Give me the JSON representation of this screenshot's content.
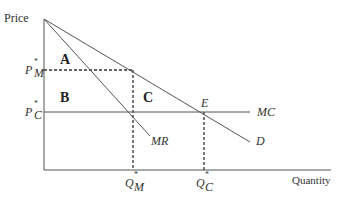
{
  "diagram": {
    "axes": {
      "y_label": "Price",
      "x_label": "Quantity"
    },
    "price_levels": [
      {
        "id": "pm",
        "symbol": "P",
        "superscript": "*",
        "subscript": "M"
      },
      {
        "id": "pc",
        "symbol": "P",
        "superscript": "*",
        "subscript": "C"
      }
    ],
    "quantity_levels": [
      {
        "id": "qm",
        "symbol": "Q",
        "superscript": "*",
        "subscript": "M"
      },
      {
        "id": "qc",
        "symbol": "Q",
        "superscript": "*",
        "subscript": "C"
      }
    ],
    "curves": [
      {
        "id": "demand",
        "label": "D"
      },
      {
        "id": "marginal_revenue",
        "label": "MR"
      },
      {
        "id": "marginal_cost",
        "label": "MC"
      }
    ],
    "regions": [
      {
        "id": "A",
        "label": "A"
      },
      {
        "id": "B",
        "label": "B"
      },
      {
        "id": "C",
        "label": "C"
      }
    ],
    "points": [
      {
        "id": "E",
        "label": "E"
      }
    ]
  }
}
